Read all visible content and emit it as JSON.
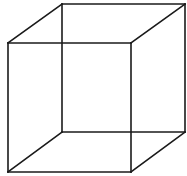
{
  "diagram": {
    "type": "wireframe-cube",
    "stroke_color": "#1a1a1a",
    "stroke_width": 1.6,
    "background": "#ffffff",
    "front_face": {
      "x1": 8,
      "y1": 43,
      "x2": 131,
      "y2": 172
    },
    "back_face": {
      "x1": 62,
      "y1": 4,
      "x2": 185,
      "y2": 132
    }
  }
}
